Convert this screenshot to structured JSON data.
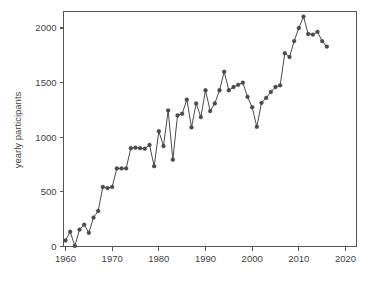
{
  "chart_data": {
    "type": "line",
    "title": "",
    "subtitle": "",
    "xlabel": "",
    "ylabel": "yearly participants",
    "xlim": [
      1958,
      2020
    ],
    "ylim": [
      -70,
      2160
    ],
    "grid": false,
    "legend": false,
    "legend_position": "none",
    "marker": "filled-circle",
    "line_color": "#4a4a4a",
    "marker_color": "#4c4c4c",
    "xticks": [
      1960,
      1970,
      1980,
      1990,
      2000,
      2010,
      2020
    ],
    "xtick_labels": [
      "1960",
      "1970",
      "1980",
      "1990",
      "2000",
      "2010",
      "2020"
    ],
    "yticks": [
      0,
      500,
      1000,
      1500,
      2000
    ],
    "ytick_labels": [
      "0",
      "500",
      "1000",
      "1500",
      "2000"
    ],
    "x": [
      1960,
      1961,
      1962,
      1963,
      1964,
      1965,
      1966,
      1967,
      1968,
      1969,
      1970,
      1971,
      1972,
      1973,
      1974,
      1975,
      1976,
      1977,
      1978,
      1979,
      1980,
      1981,
      1982,
      1983,
      1984,
      1985,
      1986,
      1987,
      1988,
      1989,
      1990,
      1991,
      1992,
      1993,
      1994,
      1995,
      1996,
      1997,
      1998,
      1999,
      2000,
      2001,
      2002,
      2003,
      2004,
      2005,
      2006,
      2007,
      2008,
      2009,
      2010,
      2011,
      2012,
      2013,
      2014,
      2015,
      2016
    ],
    "values": [
      55,
      135,
      5,
      155,
      200,
      125,
      265,
      325,
      545,
      535,
      545,
      715,
      715,
      715,
      900,
      905,
      900,
      895,
      930,
      735,
      1055,
      920,
      1245,
      795,
      1200,
      1215,
      1345,
      1090,
      1310,
      1185,
      1430,
      1240,
      1310,
      1430,
      1600,
      1430,
      1460,
      1480,
      1500,
      1370,
      1275,
      1095,
      1315,
      1360,
      1415,
      1460,
      1475,
      1770,
      1735,
      1880,
      2000,
      2105,
      1945,
      1940,
      1965,
      1880,
      1830
    ],
    "series_name": "yearly participants",
    "n_points": 57
  },
  "axis": {
    "y_title": "yearly participants"
  }
}
